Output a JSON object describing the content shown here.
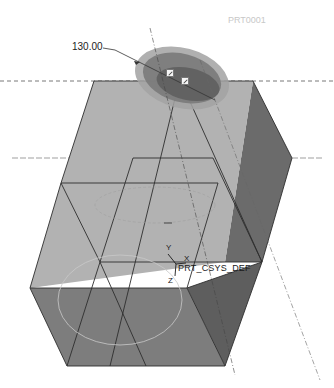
{
  "viewport": {
    "background": "#ffffff",
    "model_label": "PRT0001",
    "dimension_value": "130.00",
    "csys": {
      "name": "PRT_CSYS_DEF",
      "axes": {
        "x": "X",
        "y": "Y",
        "z": "Z"
      }
    },
    "colors": {
      "top_face": "#b9b9b9",
      "front_face": "#a9a9a9",
      "right_face": "#6b6b6b",
      "bottom_front": "#7d7d7d",
      "bottom_right": "#5e5e5e",
      "edge": "#2e2e2e",
      "datum_line": "#555555",
      "ellipse_outer": "#9a9a9a",
      "ellipse_mid": "#7a7a7a",
      "ellipse_inner": "#5f5f5f"
    },
    "drag_handles": [
      "drag-handle-1",
      "drag-handle-2"
    ]
  }
}
